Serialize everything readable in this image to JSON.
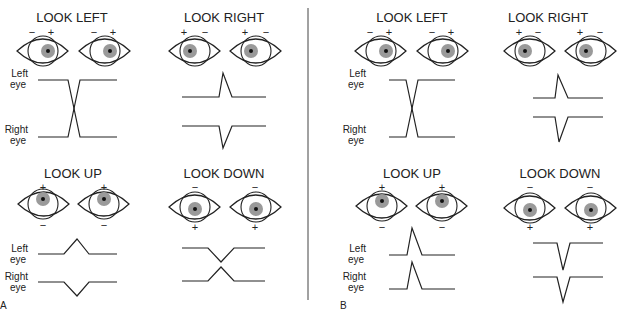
{
  "figure": {
    "panels": [
      {
        "letter": "A",
        "quadrants": [
          {
            "title": "LOOK LEFT",
            "signs": [
              [
                "−",
                "+"
              ],
              [
                "−",
                "+"
              ]
            ],
            "sign_pos": "top",
            "gaze": "left",
            "trace_labels": [
              "Left\neye",
              "Right\neye"
            ],
            "trace_type": "cross-lr"
          },
          {
            "title": "LOOK RIGHT",
            "signs": [
              [
                "+",
                "−"
              ],
              [
                "+",
                "−"
              ]
            ],
            "sign_pos": "top",
            "gaze": "right",
            "trace_labels": [],
            "trace_type": "spikes-up-down"
          },
          {
            "title": "LOOK UP",
            "signs": [
              [
                "+",
                "−"
              ],
              [
                "+",
                "−"
              ]
            ],
            "sign_pos": "topbottom",
            "gaze": "up",
            "trace_labels": [
              "Left\neye",
              "Right\neye"
            ],
            "trace_type": "up-bump-down-bump"
          },
          {
            "title": "LOOK DOWN",
            "signs": [
              [
                "−",
                "+"
              ],
              [
                "−",
                "+"
              ]
            ],
            "sign_pos": "topbottom",
            "gaze": "down",
            "trace_labels": [],
            "trace_type": "cross-ud"
          }
        ]
      },
      {
        "letter": "B",
        "quadrants": [
          {
            "title": "LOOK LEFT",
            "signs": [
              [
                "−",
                "+"
              ],
              [
                "−",
                "+"
              ]
            ],
            "sign_pos": "top",
            "gaze": "left",
            "trace_labels": [
              "Left\neye",
              "Right\neye"
            ],
            "trace_type": "cross-lr"
          },
          {
            "title": "LOOK RIGHT",
            "signs": [
              [
                "+",
                "−"
              ],
              [
                "+",
                "−"
              ]
            ],
            "sign_pos": "top",
            "gaze": "right",
            "trace_labels": [],
            "trace_type": "spikes-up-down"
          },
          {
            "title": "LOOK UP",
            "signs": [
              [
                "+",
                "−"
              ],
              [
                "+",
                "−"
              ]
            ],
            "sign_pos": "topbottom",
            "gaze": "up",
            "trace_labels": [
              "Left\neye",
              "Right\neye"
            ],
            "trace_type": "sharp-up-up"
          },
          {
            "title": "LOOK DOWN",
            "signs": [
              [
                "−",
                "+"
              ],
              [
                "−",
                "+"
              ]
            ],
            "sign_pos": "topbottom",
            "gaze": "down",
            "trace_labels": [],
            "trace_type": "sharp-down-down"
          }
        ]
      }
    ]
  },
  "text": {
    "a_ll_title": "LOOK LEFT",
    "a_lr_title": "LOOK RIGHT",
    "a_lu_title": "LOOK UP",
    "a_ld_title": "LOOK DOWN",
    "b_ll_title": "LOOK LEFT",
    "b_lr_title": "LOOK RIGHT",
    "b_lu_title": "LOOK UP",
    "b_ld_title": "LOOK DOWN",
    "left_eye_l1": "Left",
    "left_eye_l2": "eye",
    "right_eye_l1": "Right",
    "right_eye_l2": "eye",
    "minus": "−",
    "plus": "+",
    "panel_a": "A",
    "panel_b": "B"
  },
  "colors": {
    "line": "#222222",
    "iris": "#9a9a9a",
    "pupil": "#111111"
  }
}
